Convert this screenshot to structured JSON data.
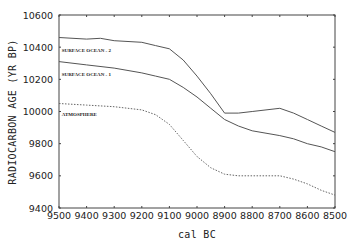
{
  "chart_data": {
    "type": "line",
    "title": "",
    "xlabel": "cal BC",
    "ylabel": "RADIOCARBON AGE (YR BP)",
    "xlim": [
      9500,
      8500
    ],
    "ylim": [
      9400,
      10600
    ],
    "x_reversed": true,
    "grid": false,
    "x_ticks": [
      9500,
      9400,
      9300,
      9200,
      9100,
      9000,
      8900,
      8800,
      8700,
      8600,
      8500
    ],
    "y_ticks": [
      9400,
      9600,
      9800,
      10000,
      10200,
      10400,
      10600
    ],
    "legend": "inline labels",
    "series": [
      {
        "name": "SURFACE OCEAN - 2",
        "style": "solid",
        "label_pos": [
          9490,
          10370
        ],
        "x": [
          9500,
          9400,
          9350,
          9300,
          9200,
          9150,
          9100,
          9050,
          9000,
          8950,
          8900,
          8850,
          8800,
          8700,
          8650,
          8600,
          8550,
          8500
        ],
        "values": [
          10460,
          10450,
          10455,
          10440,
          10430,
          10410,
          10390,
          10320,
          10220,
          10110,
          9990,
          9990,
          10000,
          10020,
          9990,
          9950,
          9910,
          9870
        ]
      },
      {
        "name": "SURFACE OCEAN - 1",
        "style": "solid",
        "label_pos": [
          9490,
          10220
        ],
        "x": [
          9500,
          9400,
          9300,
          9200,
          9150,
          9100,
          9050,
          9000,
          8950,
          8900,
          8850,
          8800,
          8700,
          8650,
          8600,
          8550,
          8500
        ],
        "values": [
          10310,
          10290,
          10270,
          10240,
          10220,
          10200,
          10150,
          10090,
          10020,
          9950,
          9910,
          9880,
          9850,
          9830,
          9800,
          9780,
          9750
        ]
      },
      {
        "name": "ATMOSPHERE",
        "style": "dotted",
        "label_pos": [
          9490,
          9970
        ],
        "x": [
          9500,
          9400,
          9300,
          9200,
          9150,
          9100,
          9050,
          9000,
          8950,
          8900,
          8850,
          8800,
          8700,
          8650,
          8600,
          8550,
          8500
        ],
        "values": [
          10050,
          10040,
          10030,
          10010,
          9980,
          9920,
          9820,
          9720,
          9650,
          9610,
          9600,
          9600,
          9600,
          9580,
          9550,
          9510,
          9480
        ]
      }
    ]
  }
}
